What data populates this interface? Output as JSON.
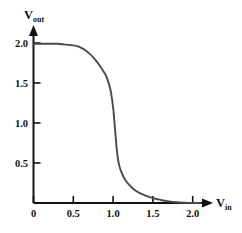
{
  "chart_data": {
    "type": "line",
    "title": "",
    "subtitle": "",
    "xlabel": "V_in",
    "ylabel": "V_out",
    "xlabel_base": "V",
    "xlabel_sub": "in",
    "ylabel_base": "V",
    "ylabel_sub": "out",
    "xlim": [
      0,
      2.25
    ],
    "ylim": [
      0,
      2.1
    ],
    "grid": false,
    "legend": null,
    "xticks": [
      0,
      0.5,
      1.0,
      1.5,
      2.0
    ],
    "xticklabels": [
      "0",
      "0.5",
      "1.0",
      "1.5",
      "2.0"
    ],
    "yticks": [
      0.5,
      1.0,
      1.5,
      2.0
    ],
    "yticklabels": [
      "0.5",
      "1.0",
      "1.5",
      "2.0"
    ],
    "series": [
      {
        "name": "voltage-transfer-characteristic",
        "color": "#4a4a4a",
        "x": [
          0.0,
          0.1,
          0.2,
          0.3,
          0.4,
          0.5,
          0.55,
          0.6,
          0.65,
          0.7,
          0.75,
          0.8,
          0.85,
          0.9,
          0.93,
          0.96,
          0.98,
          1.0,
          1.01,
          1.02,
          1.03,
          1.04,
          1.05,
          1.06,
          1.08,
          1.1,
          1.13,
          1.16,
          1.2,
          1.25,
          1.3,
          1.35,
          1.4,
          1.45,
          1.5,
          1.55,
          1.6,
          1.65,
          1.7,
          1.8,
          1.9,
          2.0,
          2.1
        ],
        "y": [
          2.0,
          2.0,
          2.0,
          2.0,
          1.99,
          1.98,
          1.97,
          1.95,
          1.92,
          1.88,
          1.83,
          1.77,
          1.7,
          1.62,
          1.55,
          1.45,
          1.35,
          1.2,
          1.1,
          0.98,
          0.86,
          0.74,
          0.64,
          0.56,
          0.46,
          0.4,
          0.33,
          0.28,
          0.23,
          0.18,
          0.145,
          0.118,
          0.095,
          0.078,
          0.062,
          0.05,
          0.038,
          0.028,
          0.02,
          0.01,
          0.004,
          0.001,
          0.0
        ]
      }
    ],
    "annotations": [],
    "axis_color": "#111111",
    "background": "#ffffff"
  },
  "axes": {
    "x_axis_name": "v-in-axis",
    "y_axis_name": "v-out-axis"
  }
}
